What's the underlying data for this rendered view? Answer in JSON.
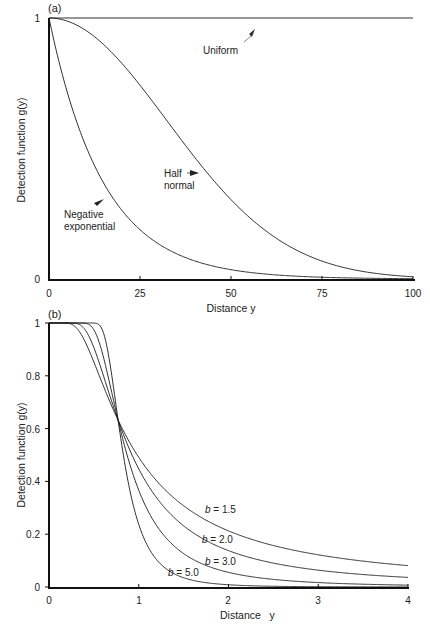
{
  "chart_data": [
    {
      "panel": "(a)",
      "type": "line",
      "title": "",
      "xlabel": "Distance y",
      "ylabel": "Detection function g(y)",
      "xlim": [
        0,
        100
      ],
      "ylim": [
        0,
        1
      ],
      "xticks": [
        0,
        25,
        50,
        75,
        100
      ],
      "yticks": [
        0,
        1
      ],
      "grid": false,
      "series": [
        {
          "name": "Uniform",
          "x": [
            0,
            25,
            50,
            75,
            100
          ],
          "y": [
            1,
            1,
            1,
            1,
            1
          ]
        },
        {
          "name": "Half normal",
          "x": [
            0,
            10,
            20,
            30,
            40,
            50,
            60,
            70,
            80,
            90,
            100
          ],
          "y": [
            1.0,
            0.953,
            0.827,
            0.651,
            0.467,
            0.304,
            0.18,
            0.097,
            0.047,
            0.021,
            0.009
          ]
        },
        {
          "name": "Negative exponential",
          "x": [
            0,
            5,
            10,
            15,
            20,
            30,
            40,
            50,
            60,
            75,
            100
          ],
          "y": [
            1.0,
            0.717,
            0.513,
            0.368,
            0.264,
            0.135,
            0.069,
            0.036,
            0.018,
            0.007,
            0.001
          ]
        }
      ],
      "annotations": [
        {
          "text": "Uniform",
          "arrow": true
        },
        {
          "text": "Half normal",
          "arrow": true
        },
        {
          "text": "Negative exponential",
          "arrow": true
        }
      ]
    },
    {
      "panel": "(b)",
      "type": "line",
      "title": "",
      "xlabel": "Distance y",
      "ylabel": "Detection function g(y)",
      "xlim": [
        0,
        4
      ],
      "ylim": [
        0,
        1
      ],
      "xticks": [
        0,
        1,
        2,
        3,
        4
      ],
      "yticks": [
        0,
        0.2,
        0.4,
        0.6,
        0.8,
        1
      ],
      "grid": false,
      "series": [
        {
          "name": "b = 1.5",
          "x": [
            0.2,
            0.5,
            0.77,
            1,
            1.5,
            2,
            3,
            4
          ],
          "y": [
            1.0,
            0.85,
            0.63,
            0.49,
            0.31,
            0.21,
            0.12,
            0.08
          ]
        },
        {
          "name": "b = 2.0",
          "x": [
            0.2,
            0.5,
            0.77,
            1,
            1.5,
            2,
            3,
            4
          ],
          "y": [
            1.0,
            0.91,
            0.63,
            0.45,
            0.23,
            0.14,
            0.06,
            0.04
          ]
        },
        {
          "name": "b = 3.0",
          "x": [
            0.2,
            0.5,
            0.77,
            1,
            1.5,
            2,
            3,
            4
          ],
          "y": [
            1.0,
            0.97,
            0.63,
            0.37,
            0.13,
            0.06,
            0.02,
            0.01
          ]
        },
        {
          "name": "b = 5.0",
          "x": [
            0.2,
            0.5,
            0.77,
            1,
            1.5,
            2,
            3,
            4
          ],
          "y": [
            1.0,
            1.0,
            0.63,
            0.24,
            0.04,
            0.01,
            0.0,
            0.0
          ]
        }
      ],
      "annotations": [
        {
          "text": "b = 1.5"
        },
        {
          "text": "b = 2.0"
        },
        {
          "text": "b = 3.0"
        },
        {
          "text": "b = 5.0"
        }
      ]
    }
  ],
  "panels": {
    "a": {
      "label": "(a)",
      "xlabel": "Distance y",
      "ylabel": "Detection function g(y)",
      "xtick_labels": [
        "0",
        "25",
        "50",
        "75",
        "100"
      ],
      "ytick_labels": [
        "0",
        "1"
      ],
      "labels": {
        "uniform": "Uniform",
        "half_line1": "Half",
        "half_line2": "normal",
        "neg_line1": "Negative",
        "neg_line2": "exponential"
      },
      "params": {
        "half_normal_sigma": 32.4,
        "neg_exp_lambda": 15
      }
    },
    "b": {
      "label": "(b)",
      "xlabel": "Distance   y",
      "ylabel": "Detection function g(y)",
      "xtick_labels": [
        "0",
        "1",
        "2",
        "3",
        "4"
      ],
      "ytick_labels": [
        "0",
        "0.2",
        "0.4",
        "0.6",
        "0.8",
        "1"
      ],
      "curve_labels": [
        {
          "b": "b",
          "eq": " = 1.5"
        },
        {
          "b": "b",
          "eq": " = 2.0"
        },
        {
          "b": "b",
          "eq": " = 3.0"
        },
        {
          "b": "b",
          "eq": " = 5.0"
        }
      ],
      "params": {
        "sigma": 0.77,
        "shapes": [
          1.5,
          2.0,
          3.0,
          5.0
        ]
      }
    }
  },
  "colors": {
    "line": "#1a1a1a",
    "axis": "#111111",
    "text": "#222222",
    "arrow": "#333333"
  }
}
